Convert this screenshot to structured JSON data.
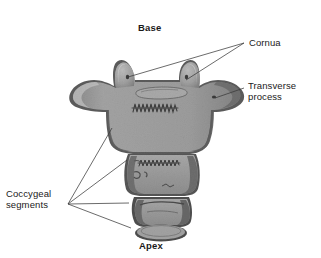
{
  "figure": {
    "background_color": "#ffffff",
    "width": 321,
    "height": 258
  },
  "labels": {
    "base": "Base",
    "apex": "Apex",
    "cornua": "Cornua",
    "transverse_process": "Transverse\nprocess",
    "coccygeal_segments": "Coccygeal\nsegments"
  },
  "colors": {
    "bone_fill": "#9d9d9d",
    "bone_fill_light": "#b0b0b0",
    "bone_shadow": "#7c7c7c",
    "bone_outline": "#4d4d4d",
    "bone_highlight": "#c6c6c6",
    "leader_line": "#3a3a3a",
    "text": "#1a1a1a",
    "background": "#ffffff"
  },
  "structures": [
    {
      "name": "coccygeal-segment-1",
      "description": "First coccygeal segment (body) with paired cornua and lateral transverse processes"
    },
    {
      "name": "coccygeal-segment-2",
      "description": "Second coccygeal segment, trapezoid"
    },
    {
      "name": "coccygeal-segment-3",
      "description": "Third coccygeal segment, smaller trapezoid"
    },
    {
      "name": "coccygeal-segment-4",
      "description": "Fourth coccygeal segment, small oval at apex"
    },
    {
      "name": "cornu-left",
      "description": "Left coccygeal cornu"
    },
    {
      "name": "cornu-right",
      "description": "Right coccygeal cornu"
    },
    {
      "name": "transverse-process-left",
      "description": "Left transverse process"
    },
    {
      "name": "transverse-process-right",
      "description": "Right transverse process"
    },
    {
      "name": "articular-surface",
      "description": "Oval articular surface on the base"
    },
    {
      "name": "suture-line-1",
      "description": "Serrated suture line on segment 1"
    },
    {
      "name": "suture-line-2",
      "description": "Serrated suture line on segment 2"
    }
  ],
  "leader_lines": [
    {
      "name": "leader-cornua-left",
      "from": [
        244,
        43
      ],
      "to": [
        128,
        77
      ]
    },
    {
      "name": "leader-cornua-right",
      "from": [
        244,
        43
      ],
      "to": [
        186,
        80
      ]
    },
    {
      "name": "leader-transverse-process",
      "from": [
        244,
        88
      ],
      "to": [
        215,
        98
      ]
    },
    {
      "name": "leader-segment-1",
      "from": [
        68,
        204
      ],
      "to": [
        112,
        128
      ]
    },
    {
      "name": "leader-segment-2",
      "from": [
        68,
        204
      ],
      "to": [
        127,
        160
      ]
    },
    {
      "name": "leader-segment-3",
      "from": [
        68,
        204
      ],
      "to": [
        129,
        203
      ]
    },
    {
      "name": "leader-segment-4",
      "from": [
        68,
        204
      ],
      "to": [
        131,
        228
      ]
    }
  ]
}
